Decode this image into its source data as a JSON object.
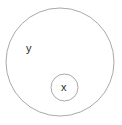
{
  "diagram": {
    "type": "set-containment-venn",
    "background_color": "#ffffff",
    "stroke_color": "#a9a9a9",
    "label_color": "#2b2b2b",
    "stroke_width": 1,
    "outer_set": {
      "label": "y",
      "shape": "circle",
      "center_x": 60,
      "center_y": 62,
      "radius": 54,
      "label_x": 30,
      "label_y": 50
    },
    "inner_set": {
      "label": "x",
      "shape": "circle",
      "center_x": 64.5,
      "center_y": 87.5,
      "radius": 13.5,
      "label_x": 64.5,
      "label_y": 88
    }
  }
}
